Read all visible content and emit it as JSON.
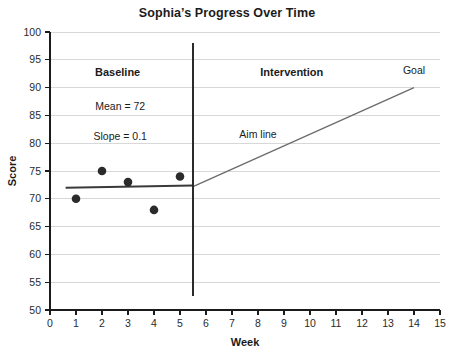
{
  "chart_data": {
    "type": "scatter",
    "title": "Sophia’s Progress Over Time",
    "xlabel": "Week",
    "ylabel": "Score",
    "xlim": [
      0,
      15
    ],
    "ylim": [
      50,
      100
    ],
    "xticks": [
      0,
      1,
      2,
      3,
      4,
      5,
      6,
      7,
      8,
      9,
      10,
      11,
      12,
      13,
      14,
      15
    ],
    "yticks": [
      50,
      55,
      60,
      65,
      70,
      75,
      80,
      85,
      90,
      95,
      100
    ],
    "grid": "horizontal",
    "legend": "none",
    "series": [
      {
        "name": "Baseline data points",
        "marker": "filled-circle",
        "color": "#2b2b2b",
        "x": [
          1,
          2,
          3,
          4,
          5
        ],
        "values": [
          70,
          75,
          73,
          68,
          74
        ]
      }
    ],
    "lines": [
      {
        "name": "Baseline trend line",
        "color": "#3a3a3a",
        "x": [
          0.6,
          5.5
        ],
        "y": [
          72,
          72.4
        ]
      },
      {
        "name": "Aim line",
        "color": "#6b6b6b",
        "x": [
          5.5,
          14
        ],
        "y": [
          72.2,
          90
        ]
      }
    ],
    "phase_line": {
      "name": "Phase change line",
      "x": 5.5,
      "y_top": 98,
      "y_bottom": 52.5,
      "color": "#2b2b2b"
    },
    "annotations": [
      {
        "text": "Baseline",
        "x": 2.6,
        "y": 92,
        "bold": true
      },
      {
        "text": "Mean = 72",
        "x": 2.7,
        "y": 86,
        "bold": false
      },
      {
        "text": "Slope = 0.1",
        "x": 2.7,
        "y": 80.5,
        "bold": false
      },
      {
        "text": "Intervention",
        "x": 9.3,
        "y": 92,
        "bold": true
      },
      {
        "text": "Goal",
        "x": 14.0,
        "y": 92.5,
        "bold": false
      },
      {
        "text": "Aim line",
        "x": 8.0,
        "y": 81,
        "bold": false
      }
    ]
  },
  "axes": {
    "y_title": "Score",
    "x_title": "Week",
    "y_tick_labels": [
      "100",
      "95",
      "90",
      "85",
      "80",
      "75",
      "70",
      "65",
      "60",
      "55",
      "50"
    ],
    "x_tick_labels": [
      "0",
      "1",
      "2",
      "3",
      "4",
      "5",
      "6",
      "7",
      "8",
      "9",
      "10",
      "11",
      "12",
      "13",
      "14",
      "15"
    ]
  },
  "annotations": {
    "baseline": "Baseline",
    "mean": "Mean = 72",
    "slope": "Slope = 0.1",
    "intervention": "Intervention",
    "goal": "Goal",
    "aim_line": "Aim line"
  },
  "colors": {
    "gridline": "#d8d8d8",
    "axis": "#1b1b1b",
    "marker": "#2b2b2b",
    "trend": "#3a3a3a",
    "aim": "#6b6b6b",
    "background": "#ffffff"
  }
}
